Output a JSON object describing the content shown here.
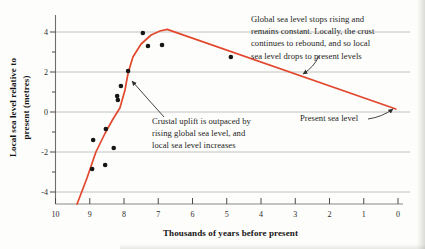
{
  "figure": {
    "background": "#fdfdfb"
  },
  "chart_data": {
    "type": "line",
    "title": "",
    "xlabel": "Thousands of years before present",
    "ylabel_lines": [
      "Local sea level relative to",
      "present (metres)"
    ],
    "x_ticks": [
      10,
      9,
      8,
      7,
      6,
      5,
      4,
      3,
      2,
      1,
      0
    ],
    "y_ticks": [
      4,
      2,
      0,
      -2,
      -4
    ],
    "y_minor_ticks": [
      3,
      1,
      -1,
      -3
    ],
    "xlim": [
      10,
      0
    ],
    "ylim": [
      -4.6,
      4.75
    ],
    "grid": "horizontal",
    "legend": "none",
    "line_color": "#e2482e",
    "point_color": "#161616",
    "grid_color": "#c2c2c2",
    "axis_color": "#8a8a8a",
    "tick_color": "#4a4a4a",
    "text_color": "#2b2b2b",
    "series": [
      {
        "name": "Relative local sea level curve",
        "type": "line",
        "points": [
          [
            9.37,
            -4.6
          ],
          [
            9.08,
            -3.3
          ],
          [
            8.82,
            -2.0
          ],
          [
            8.55,
            -1.05
          ],
          [
            8.32,
            -0.35
          ],
          [
            8.12,
            0.2
          ],
          [
            7.97,
            1.1
          ],
          [
            7.88,
            1.95
          ],
          [
            7.74,
            2.75
          ],
          [
            7.5,
            3.4
          ],
          [
            7.21,
            3.85
          ],
          [
            6.95,
            4.05
          ],
          [
            6.74,
            4.13
          ],
          [
            0.06,
            0.15
          ]
        ]
      },
      {
        "name": "Observed sea level data points",
        "type": "scatter",
        "points": [
          [
            7.45,
            3.95
          ],
          [
            7.3,
            3.3
          ],
          [
            6.89,
            3.35
          ],
          [
            7.88,
            2.05
          ],
          [
            8.09,
            1.3
          ],
          [
            8.2,
            0.8
          ],
          [
            8.18,
            0.6
          ],
          [
            8.53,
            -0.85
          ],
          [
            8.9,
            -1.4
          ],
          [
            8.3,
            -1.8
          ],
          [
            8.55,
            -2.65
          ],
          [
            8.93,
            -2.85
          ],
          [
            4.88,
            2.75
          ]
        ]
      }
    ],
    "annotations": {
      "rebound": {
        "lines": [
          "Global sea level stops rising and",
          "remains constant. Locally, the crust",
          "continues to rebound, and so local",
          "sea level drops to present levels"
        ],
        "arrow": {
          "from_px": [
            319,
            56
          ],
          "ctrl_px": [
            314,
            67
          ],
          "to_px": [
            303,
            74
          ]
        }
      },
      "uplift": {
        "lines": [
          "Crustal uplift is outpaced by",
          "rising global sea level, and",
          "local sea level increases"
        ],
        "arrow": {
          "from_px": [
            164,
            117
          ],
          "ctrl_px": [
            146,
            97
          ],
          "to_px": [
            132,
            81
          ]
        }
      },
      "present": {
        "label": "Present sea level",
        "arrow": {
          "from_px": [
            368,
            119
          ],
          "ctrl_px": [
            382,
            117
          ],
          "to_px": [
            393,
            109
          ]
        }
      }
    }
  }
}
